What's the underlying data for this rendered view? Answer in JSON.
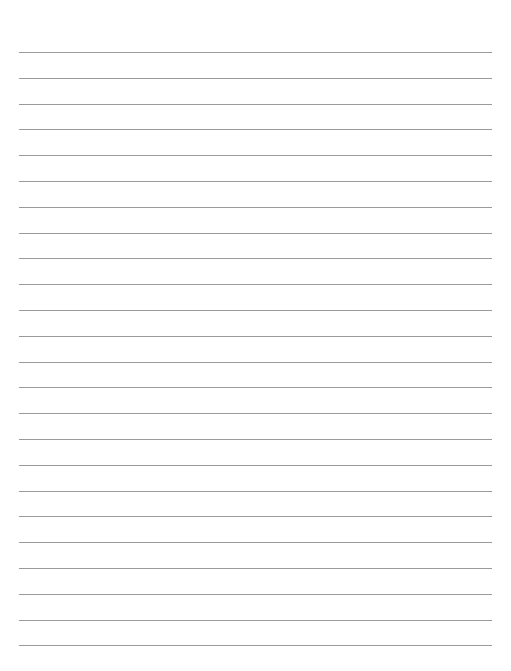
{
  "page": {
    "type": "lined-paper",
    "background": "#ffffff",
    "line_color": "#9a9a9a",
    "line_count": 24,
    "first_line_y": 52,
    "line_spacing": 25.8,
    "line_left": 19,
    "line_right": 492
  }
}
